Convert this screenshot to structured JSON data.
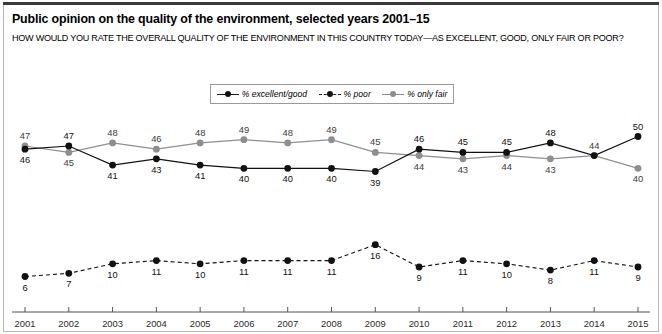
{
  "figure": {
    "title": "Public opinion on the quality of the environment, selected years 2001–15",
    "subtitle": "HOW WOULD YOU RATE THE OVERALL QUALITY OF THE ENVIRONMENT IN THIS COUNTRY TODAY—AS EXCELLENT, GOOD, ONLY FAIR OR POOR?"
  },
  "colors": {
    "excellent_good": "#111111",
    "poor": "#111111",
    "only_fair": "#8e8e8e",
    "axis": "#555555",
    "frame": "#b9b9b9",
    "rule": "#3a3a3a"
  },
  "legend": {
    "position": "top-center",
    "items": [
      {
        "label": "% excellent/good",
        "marker": "filled-circle",
        "line": "solid",
        "color": "#111111"
      },
      {
        "label": "% poor",
        "marker": "filled-circle",
        "line": "dashed",
        "color": "#111111"
      },
      {
        "label": "% only fair",
        "marker": "filled-circle",
        "line": "solid",
        "color": "#8e8e8e"
      }
    ]
  },
  "chart_data": {
    "type": "line",
    "title": "Public opinion on the quality of the environment, selected years 2001–15",
    "subtitle": "HOW WOULD YOU RATE THE OVERALL QUALITY OF THE ENVIRONMENT IN THIS COUNTRY TODAY—AS EXCELLENT, GOOD, ONLY FAIR OR POOR?",
    "xlabel": "",
    "ylabel": "",
    "x": [
      2001,
      2002,
      2003,
      2004,
      2005,
      2006,
      2007,
      2008,
      2009,
      2010,
      2011,
      2012,
      2013,
      2014,
      2015
    ],
    "categories": [
      "2001",
      "2002",
      "2003",
      "2004",
      "2005",
      "2006",
      "2007",
      "2008",
      "2009",
      "2010",
      "2011",
      "2012",
      "2013",
      "2014",
      "2015"
    ],
    "ylim": [
      0,
      55
    ],
    "grid": false,
    "legend_position": "top-center",
    "series": [
      {
        "name": "% excellent/good",
        "color": "#111111",
        "line": "solid",
        "values": [
          46,
          47,
          41,
          43,
          41,
          40,
          40,
          40,
          39,
          46,
          45,
          45,
          48,
          44,
          50
        ],
        "label_positions": [
          "below",
          "above",
          "below",
          "below",
          "below",
          "below",
          "below",
          "below",
          "below",
          "above",
          "above",
          "above",
          "above",
          "above",
          "above"
        ]
      },
      {
        "name": "% only fair",
        "color": "#8e8e8e",
        "line": "solid",
        "values": [
          47,
          45,
          48,
          46,
          48,
          49,
          48,
          49,
          45,
          44,
          43,
          44,
          43,
          44,
          40
        ],
        "label_positions": [
          "above",
          "below",
          "above",
          "above",
          "above",
          "above",
          "above",
          "above",
          "above",
          "below",
          "below",
          "below",
          "below",
          "above",
          "below"
        ]
      },
      {
        "name": "% poor",
        "color": "#111111",
        "line": "dashed",
        "values": [
          6,
          7,
          10,
          11,
          10,
          11,
          11,
          11,
          16,
          9,
          11,
          10,
          8,
          11,
          9
        ],
        "label_positions": [
          "below",
          "below",
          "below",
          "below",
          "below",
          "below",
          "below",
          "below",
          "below",
          "below",
          "below",
          "below",
          "below",
          "below",
          "below"
        ]
      }
    ]
  }
}
